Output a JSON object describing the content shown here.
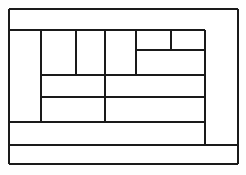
{
  "figure": {
    "kind": "line-diagram",
    "background_color": "#fdfdfc",
    "paper_color": "#ffffff",
    "stroke_color": "#1a1a1a",
    "canvas": {
      "width": 246,
      "height": 175
    }
  },
  "geometry": {
    "outer_rect": {
      "x": 9,
      "y": 9,
      "width": 229,
      "height": 155
    },
    "x_guides": [
      9,
      41,
      76,
      105,
      136,
      171,
      205,
      238
    ],
    "y_guides": [
      9,
      30,
      50,
      75,
      97,
      122,
      145,
      164
    ],
    "stroke_widths": {
      "outer": 2.2,
      "major": 2.0,
      "minor": 1.6
    }
  },
  "edges": {
    "horizontal": [
      {
        "name": "outer-top-edge",
        "x1": 9,
        "x2": 238,
        "y": 9,
        "weight": "outer"
      },
      {
        "name": "top-band-bottom",
        "x1": 9,
        "x2": 205,
        "y": 30,
        "weight": "major"
      },
      {
        "name": "upper-right-split",
        "x1": 136,
        "x2": 205,
        "y": 50,
        "weight": "minor"
      },
      {
        "name": "mid-upper-edge",
        "x1": 41,
        "x2": 205,
        "y": 75,
        "weight": "minor"
      },
      {
        "name": "mid-lower-edge",
        "x1": 41,
        "x2": 205,
        "y": 97,
        "weight": "minor"
      },
      {
        "name": "lower-band-top",
        "x1": 9,
        "x2": 205,
        "y": 122,
        "weight": "minor"
      },
      {
        "name": "bottom-band-top",
        "x1": 9,
        "x2": 238,
        "y": 145,
        "weight": "minor"
      },
      {
        "name": "outer-bottom-edge",
        "x1": 9,
        "x2": 238,
        "y": 164,
        "weight": "outer"
      }
    ],
    "vertical": [
      {
        "name": "outer-left-edge",
        "y1": 9,
        "y2": 164,
        "x": 9,
        "weight": "outer"
      },
      {
        "name": "left-column-divider",
        "y1": 30,
        "y2": 122,
        "x": 41,
        "weight": "minor"
      },
      {
        "name": "cell-divider-a",
        "y1": 30,
        "y2": 75,
        "x": 76,
        "weight": "minor"
      },
      {
        "name": "cell-divider-b",
        "y1": 30,
        "y2": 122,
        "x": 105,
        "weight": "minor"
      },
      {
        "name": "cell-divider-c",
        "y1": 30,
        "y2": 75,
        "x": 136,
        "weight": "minor"
      },
      {
        "name": "cell-divider-d",
        "y1": 30,
        "y2": 50,
        "x": 171,
        "weight": "minor"
      },
      {
        "name": "inner-right-edge",
        "y1": 30,
        "y2": 145,
        "x": 205,
        "weight": "major"
      },
      {
        "name": "outer-right-edge",
        "y1": 9,
        "y2": 164,
        "x": 238,
        "weight": "outer"
      }
    ]
  },
  "regions": [
    {
      "name": "region-top-band",
      "x": 9,
      "y": 9,
      "width": 229,
      "height": 21
    },
    {
      "name": "region-left-column",
      "x": 9,
      "y": 30,
      "width": 32,
      "height": 92
    },
    {
      "name": "region-cell-1",
      "x": 41,
      "y": 30,
      "width": 35,
      "height": 45
    },
    {
      "name": "region-cell-2",
      "x": 76,
      "y": 30,
      "width": 29,
      "height": 45
    },
    {
      "name": "region-cell-3",
      "x": 105,
      "y": 30,
      "width": 31,
      "height": 45
    },
    {
      "name": "region-cell-4",
      "x": 136,
      "y": 30,
      "width": 35,
      "height": 20
    },
    {
      "name": "region-cell-5",
      "x": 171,
      "y": 30,
      "width": 34,
      "height": 20
    },
    {
      "name": "region-cell-6",
      "x": 136,
      "y": 50,
      "width": 69,
      "height": 25
    },
    {
      "name": "region-mid-left",
      "x": 41,
      "y": 75,
      "width": 64,
      "height": 22
    },
    {
      "name": "region-mid-right",
      "x": 105,
      "y": 75,
      "width": 100,
      "height": 22
    },
    {
      "name": "region-lower-wide",
      "x": 41,
      "y": 97,
      "width": 164,
      "height": 25
    },
    {
      "name": "region-right-column",
      "x": 205,
      "y": 30,
      "width": 33,
      "height": 115
    },
    {
      "name": "region-lower-band",
      "x": 9,
      "y": 122,
      "width": 196,
      "height": 23
    },
    {
      "name": "region-bottom-band",
      "x": 9,
      "y": 145,
      "width": 229,
      "height": 19
    }
  ]
}
